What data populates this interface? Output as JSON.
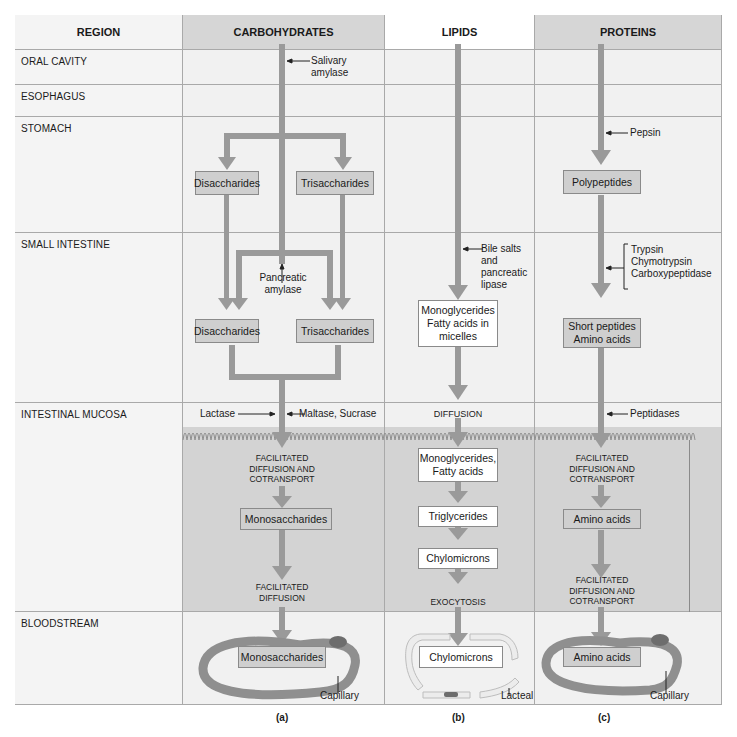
{
  "table": {
    "headers": {
      "region": "REGION",
      "carbohydrates": "CARBOHYDRATES",
      "lipids": "LIPIDS",
      "proteins": "PROTEINS"
    },
    "regions": [
      "ORAL CAVITY",
      "ESOPHAGUS",
      "STOMACH",
      "SMALL INTESTINE",
      "INTESTINAL MUCOSA",
      "BLOODSTREAM"
    ]
  },
  "carbohydrates": {
    "enzymes": {
      "salivary": "Salivary\namylase",
      "pancreatic": "Pancreatic\namylase",
      "lactase": "Lactase",
      "maltase_sucrase": "Maltase, Sucrase"
    },
    "stomach_boxes": [
      "Disaccharides",
      "Trisaccharides"
    ],
    "intestine_boxes": [
      "Disaccharides",
      "Trisaccharides"
    ],
    "transport_1": "FACILITATED\nDIFFUSION AND\nCOTRANSPORT",
    "mucosa_box": "Monosaccharides",
    "transport_2": "FACILITATED\nDIFFUSION",
    "blood_box": "Monosaccharides",
    "vessel_label": "Capillary",
    "panel_label": "(a)"
  },
  "lipids": {
    "enzymes": {
      "bile": "Bile salts\nand\npancreatic\nlipase"
    },
    "intestine_box": "Monoglycerides\nFatty acids in\nmicelles",
    "transport_1": "DIFFUSION",
    "mucosa_boxes": [
      "Monoglycerides,\nFatty acids",
      "Triglycerides",
      "Chylomicrons"
    ],
    "transport_2": "EXOCYTOSIS",
    "blood_box": "Chylomicrons",
    "vessel_label": "Lacteal",
    "panel_label": "(b)"
  },
  "proteins": {
    "enzymes": {
      "pepsin": "Pepsin",
      "pancreatic": "Trypsin\nChymotrypsin\nCarboxypeptidase",
      "peptidases": "Peptidases"
    },
    "stomach_box": "Polypeptides",
    "intestine_box": "Short peptides\nAmino acids",
    "transport_1": "FACILITATED\nDIFFUSION AND\nCOTRANSPORT",
    "mucosa_box": "Amino acids",
    "transport_2": "FACILITATED\nDIFFUSION AND\nCOTRANSPORT",
    "blood_box": "Amino acids",
    "vessel_label": "Capillary",
    "panel_label": "(c)"
  },
  "colors": {
    "arrow": "#9a9a9a",
    "header_shaded": "#d6d6d6",
    "cell_light": "#f1f1f1",
    "mucosa": "#d3d3d3",
    "box_shaded": "#cfcfcf",
    "capillary": "#8f8f8f",
    "lacteal": "#e6e6e6"
  }
}
